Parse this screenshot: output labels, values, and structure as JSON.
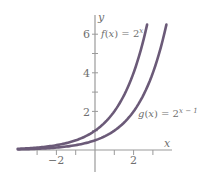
{
  "chart_data": {
    "type": "line",
    "title": "",
    "xlabel": "x",
    "ylabel": "y",
    "xlim": [
      -4,
      4
    ],
    "ylim": [
      -0.5,
      6.8
    ],
    "grid": false,
    "x_ticks": [
      -3,
      -2,
      -1,
      1,
      2,
      3
    ],
    "x_tick_labels": {
      "-2": "−2",
      "2": "2"
    },
    "y_ticks": [
      1,
      2,
      3,
      4,
      5,
      6
    ],
    "y_tick_labels": {
      "2": "2",
      "4": "4",
      "6": "6"
    },
    "series": [
      {
        "name": "f(x) = 2^x",
        "label_parts": {
          "func": "f",
          "arg": "x",
          "base": "2",
          "exp": "x"
        },
        "formula": "2^x",
        "x_range": [
          -4,
          2.7
        ],
        "x": [
          -4,
          -3,
          -2,
          -1,
          0,
          1,
          2,
          2.7
        ],
        "values": [
          0.0625,
          0.125,
          0.25,
          0.5,
          1,
          2,
          4,
          6.5
        ]
      },
      {
        "name": "g(x) = 2^(x-1)",
        "label_parts": {
          "func": "g",
          "arg": "x",
          "base": "2",
          "exp": "x − 1"
        },
        "formula": "2^(x-1)",
        "x_range": [
          -4,
          3.7
        ],
        "x": [
          -4,
          -3,
          -2,
          -1,
          0,
          1,
          2,
          3,
          3.7
        ],
        "values": [
          0.03125,
          0.0625,
          0.125,
          0.25,
          0.5,
          1,
          2,
          4,
          6.5
        ]
      }
    ],
    "colors": {
      "curve": "#6b5a78",
      "axis": "#9a9a9a",
      "text": "#6f6f6f"
    }
  }
}
